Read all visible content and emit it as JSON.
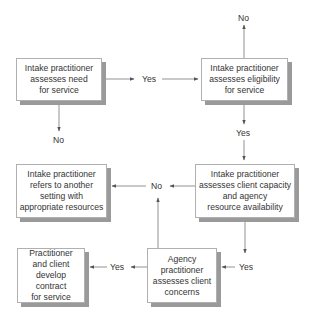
{
  "diagram": {
    "type": "flowchart",
    "colors": {
      "background": "#ffffff",
      "box_border": "#b0b0b0",
      "box_shadow": "#9a9a9a",
      "line": "#555555",
      "text": "#333333"
    },
    "nodes": [
      {
        "id": "need",
        "text": "Intake practitioner\nassesses need\nfor service"
      },
      {
        "id": "eligibility",
        "text": "Intake practitioner\nassesses eligibility\nfor service"
      },
      {
        "id": "refer",
        "text": "Intake practitioner\nrefers to another\nsetting with\nappropriate resources"
      },
      {
        "id": "capacity",
        "text": "Intake practitioner\nassesses client capacity\nand agency\nresource availability"
      },
      {
        "id": "contract",
        "text": "Practitioner\nand client\ndevelop contract\nfor service"
      },
      {
        "id": "concerns",
        "text": "Agency\npractitioner\nassesses client\nconcerns"
      }
    ],
    "labels": {
      "need_yes": "Yes",
      "need_no": "No",
      "eligibility_no": "No",
      "eligibility_yes": "Yes",
      "capacity_no": "No",
      "capacity_yes": "Yes",
      "concerns_yes": "Yes"
    },
    "edges": [
      {
        "from": "need",
        "to": "eligibility",
        "label": "Yes"
      },
      {
        "from": "need",
        "to": "end",
        "label": "No"
      },
      {
        "from": "eligibility",
        "to": "end",
        "label": "No"
      },
      {
        "from": "eligibility",
        "to": "capacity",
        "label": "Yes"
      },
      {
        "from": "capacity",
        "to": "refer",
        "label": "No"
      },
      {
        "from": "capacity",
        "to": "concerns",
        "label": "Yes"
      },
      {
        "from": "concerns",
        "to": "refer",
        "label": "No"
      },
      {
        "from": "concerns",
        "to": "contract",
        "label": "Yes"
      }
    ]
  }
}
